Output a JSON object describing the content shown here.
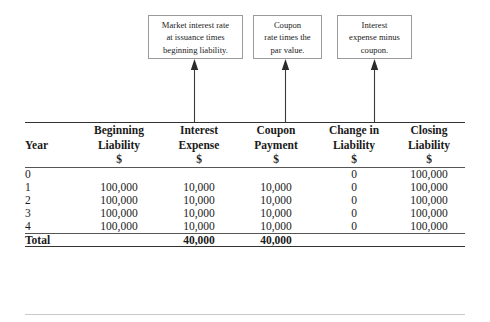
{
  "callouts": [
    {
      "id": "market-interest-rate-note",
      "lines": [
        "Market interest rate",
        "at issuance times",
        "beginning liability."
      ]
    },
    {
      "id": "coupon-rate-note",
      "lines": [
        "Coupon",
        "rate times the",
        "par value."
      ]
    },
    {
      "id": "interest-expense-note",
      "lines": [
        "Interest",
        "expense minus",
        "coupon."
      ]
    }
  ],
  "table": {
    "headers": [
      {
        "key": "year",
        "lines": [
          "Year"
        ]
      },
      {
        "key": "begin",
        "lines": [
          "Beginning",
          "Liability",
          "$"
        ]
      },
      {
        "key": "interest",
        "lines": [
          "Interest",
          "Expense",
          "$"
        ]
      },
      {
        "key": "coupon",
        "lines": [
          "Coupon",
          "Payment",
          "$"
        ]
      },
      {
        "key": "change",
        "lines": [
          "Change in",
          "Liability",
          "$"
        ]
      },
      {
        "key": "closing",
        "lines": [
          "Closing",
          "Liability",
          "$"
        ]
      }
    ],
    "rows": [
      {
        "year": "0",
        "begin": "",
        "interest": "",
        "coupon": "",
        "change": "0",
        "closing": "100,000"
      },
      {
        "year": "1",
        "begin": "100,000",
        "interest": "10,000",
        "coupon": "10,000",
        "change": "0",
        "closing": "100,000"
      },
      {
        "year": "2",
        "begin": "100,000",
        "interest": "10,000",
        "coupon": "10,000",
        "change": "0",
        "closing": "100,000"
      },
      {
        "year": "3",
        "begin": "100,000",
        "interest": "10,000",
        "coupon": "10,000",
        "change": "0",
        "closing": "100,000"
      },
      {
        "year": "4",
        "begin": "100,000",
        "interest": "10,000",
        "coupon": "10,000",
        "change": "0",
        "closing": "100,000"
      }
    ],
    "total": {
      "year": "Total",
      "begin": "",
      "interest": "40,000",
      "coupon": "40,000",
      "change": "",
      "closing": ""
    }
  },
  "colors": {
    "text": "#1a1a1a",
    "rule_heavy": "#333333",
    "rule_light": "#555555",
    "callout_border": "#9a9a9a",
    "arrow": "#3a3a3a",
    "background": "#ffffff"
  }
}
